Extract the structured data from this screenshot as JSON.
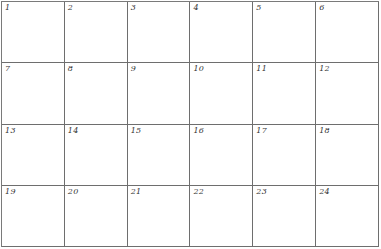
{
  "grid": {
    "columns": 6,
    "rows": 4,
    "line_color": "#6e6e6e",
    "cells": [
      {
        "label": "1"
      },
      {
        "label": "2"
      },
      {
        "label": "3"
      },
      {
        "label": "4"
      },
      {
        "label": "5"
      },
      {
        "label": "6"
      },
      {
        "label": "7"
      },
      {
        "label": "8"
      },
      {
        "label": "9"
      },
      {
        "label": "10"
      },
      {
        "label": "11"
      },
      {
        "label": "12"
      },
      {
        "label": "13"
      },
      {
        "label": "14"
      },
      {
        "label": "15"
      },
      {
        "label": "16"
      },
      {
        "label": "17"
      },
      {
        "label": "18"
      },
      {
        "label": "19"
      },
      {
        "label": "20"
      },
      {
        "label": "21"
      },
      {
        "label": "22"
      },
      {
        "label": "23"
      },
      {
        "label": "24"
      }
    ]
  }
}
